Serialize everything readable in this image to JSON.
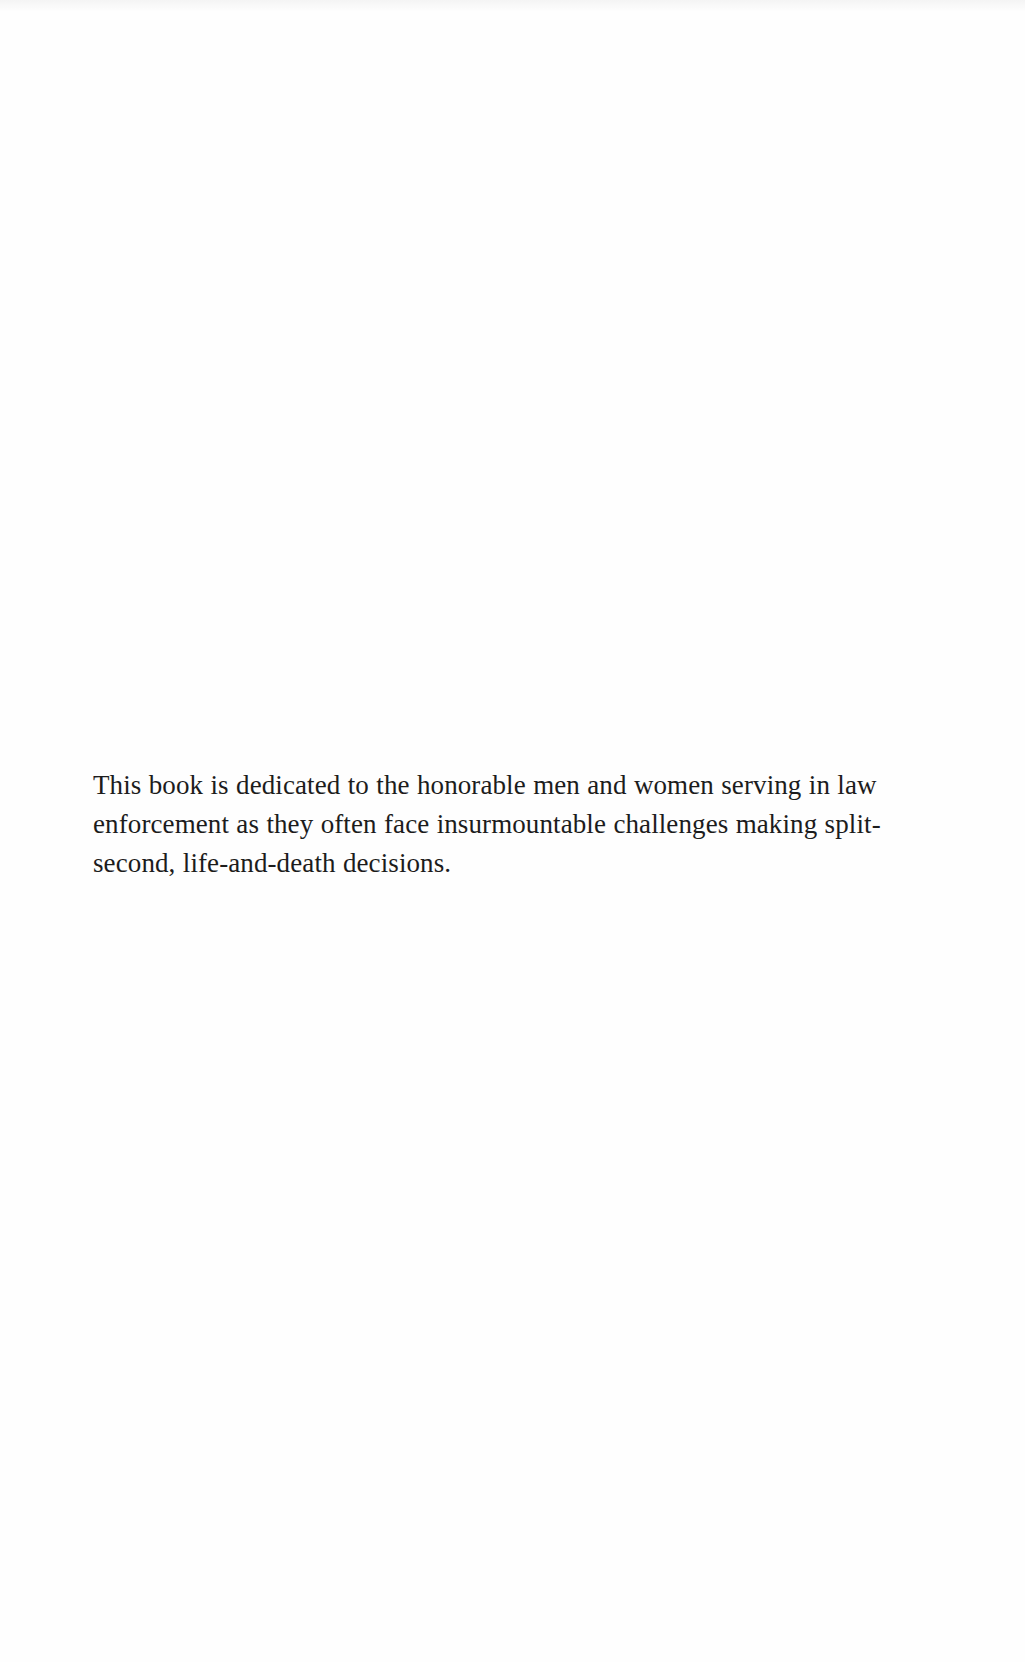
{
  "document": {
    "type": "book-dedication-page",
    "dedication": {
      "lines": [
        "This book is dedicated to the honorable men and women serving in law",
        "enforcement as they often face insurmountable challenges making split-",
        "second, life-and-death decisions."
      ]
    }
  }
}
